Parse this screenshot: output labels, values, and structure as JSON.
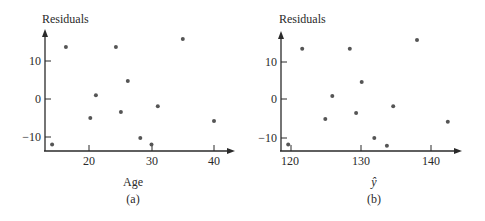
{
  "chart_data": [
    {
      "type": "scatter",
      "panel_label": "(a)",
      "title": "",
      "xlabel": "Age",
      "ylabel": "Residuals",
      "xticks": [
        20,
        30,
        40
      ],
      "yticks": [
        -10,
        0,
        10
      ],
      "xlim": [
        13.8,
        44.5
      ],
      "ylim": [
        -13.7,
        18
      ],
      "grid": false,
      "legend": null,
      "points": [
        {
          "x": 14.1,
          "y": -12.0
        },
        {
          "x": 16.3,
          "y": 13.7
        },
        {
          "x": 20.2,
          "y": -5.0
        },
        {
          "x": 21.1,
          "y": 1.0
        },
        {
          "x": 24.3,
          "y": 13.7
        },
        {
          "x": 25.1,
          "y": -3.4
        },
        {
          "x": 26.2,
          "y": 4.7
        },
        {
          "x": 28.2,
          "y": -10.3
        },
        {
          "x": 30.0,
          "y": -12.0
        },
        {
          "x": 31.0,
          "y": -1.9
        },
        {
          "x": 35.0,
          "y": 15.8
        },
        {
          "x": 40.0,
          "y": -5.8
        }
      ]
    },
    {
      "type": "scatter",
      "panel_label": "(b)",
      "title": "",
      "xlabel": "ŷ",
      "ylabel": "Residuals",
      "xticks": [
        120,
        130,
        140
      ],
      "yticks": [
        -10,
        0,
        10
      ],
      "xlim": [
        118.7,
        145
      ],
      "ylim": [
        -13.7,
        18
      ],
      "grid": false,
      "legend": null,
      "points": [
        {
          "x": 119.6,
          "y": -12.0
        },
        {
          "x": 121.6,
          "y": 13.2
        },
        {
          "x": 124.9,
          "y": -5.3
        },
        {
          "x": 125.9,
          "y": 0.8
        },
        {
          "x": 128.4,
          "y": 13.2
        },
        {
          "x": 129.3,
          "y": -3.7
        },
        {
          "x": 130.1,
          "y": 4.5
        },
        {
          "x": 131.9,
          "y": -10.3
        },
        {
          "x": 133.7,
          "y": -12.3
        },
        {
          "x": 134.6,
          "y": -1.9
        },
        {
          "x": 138.0,
          "y": 15.5
        },
        {
          "x": 142.4,
          "y": -6.0
        }
      ]
    }
  ],
  "panels": [
    {
      "ylabel": "Residuals",
      "xlabel": "Age",
      "caption": "(a)",
      "xtick_labels": [
        "20",
        "30",
        "40"
      ],
      "ytick_labels": [
        "10",
        "0",
        "−10"
      ]
    },
    {
      "ylabel": "Residuals",
      "xlabel": "ŷ",
      "caption": "(b)",
      "xtick_labels": [
        "120",
        "130",
        "140"
      ],
      "ytick_labels": [
        "10",
        "0",
        "−10"
      ]
    }
  ],
  "style": {
    "ink": "#2a2a2a",
    "point": "#555555"
  }
}
